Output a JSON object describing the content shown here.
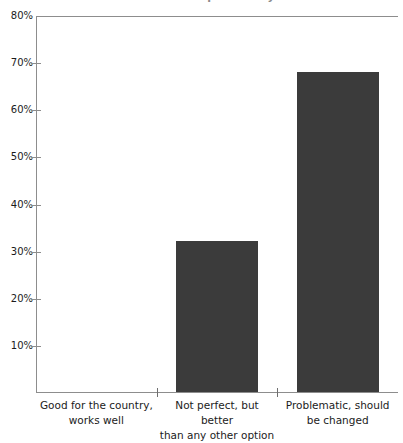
{
  "chart_data": {
    "type": "bar",
    "title": "Views of the U.S. political system",
    "subtitle": "",
    "xlabel": "",
    "ylabel": "",
    "categories": [
      "Good for the country, works well",
      "Not perfect, but better than any other option",
      "Problematic, should be changed"
    ],
    "category_lines": [
      [
        "Good for the country,",
        "works well"
      ],
      [
        "Not perfect, but better",
        "than any other option"
      ],
      [
        "Problematic, should",
        "be changed"
      ]
    ],
    "values": [
      0,
      32,
      68
    ],
    "value_labels": [
      "",
      "32%",
      "68%"
    ],
    "ylim": [
      0,
      80
    ],
    "ytick_values": [
      10,
      20,
      30,
      40,
      50,
      60,
      70,
      80
    ],
    "ytick_labels": [
      "10%",
      "20%",
      "30%",
      "40%",
      "50%",
      "60%",
      "70%",
      "80%"
    ],
    "grid": false,
    "legend": false,
    "legend_position": "none",
    "bar_color": "#3b3b3b",
    "axis_color": "#8d8d8d",
    "text_color": "#1b1b1b",
    "background_color": "#ffffff"
  }
}
